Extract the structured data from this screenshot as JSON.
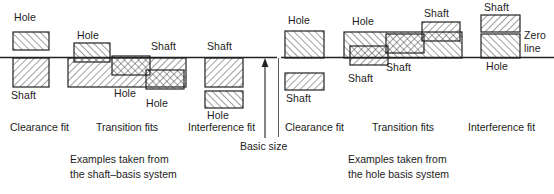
{
  "figure": {
    "zero_line_label": "Zero\nline",
    "zero_line_label_line1": "Zero",
    "zero_line_label_line2": "line",
    "basic_size_label": "Basic size",
    "colors": {
      "ink": "#1c1c1c",
      "line": "#222222",
      "hatch": "#2b2b2b",
      "background": "#ffffff"
    }
  },
  "panels": [
    {
      "id": "shaft-basis",
      "caption_line1": "Examples taken from",
      "caption_line2": "the shaft–basis system",
      "fit_labels": [
        "Clearance fit",
        "Transition fits",
        "Interference fit"
      ],
      "groups": [
        {
          "name": "clearance-fit",
          "boxes": [
            {
              "part": "Hole",
              "label": "Hole",
              "label_pos": "above"
            },
            {
              "part": "Shaft",
              "label": "Shaft",
              "label_pos": "below"
            }
          ]
        },
        {
          "name": "transition-fits",
          "boxes": [
            {
              "part": "Shaft",
              "label": "Shaft",
              "label_pos": "above"
            },
            {
              "part": "Hole",
              "label": "Hole",
              "label_pos": "above"
            },
            {
              "part": "Hole",
              "label": "Hole",
              "label_pos": "below"
            },
            {
              "part": "Hole",
              "label": "Hole",
              "label_pos": "below"
            }
          ]
        },
        {
          "name": "interference-fit",
          "boxes": [
            {
              "part": "Shaft",
              "label": "Shaft",
              "label_pos": "above"
            },
            {
              "part": "Hole",
              "label": "Hole",
              "label_pos": "below"
            }
          ]
        }
      ]
    },
    {
      "id": "hole-basis",
      "caption_line1": "Examples taken from",
      "caption_line2": "the hole  basis system",
      "fit_labels": [
        "Clearance fit",
        "Transition fits",
        "Interference fit"
      ],
      "groups": [
        {
          "name": "clearance-fit",
          "boxes": [
            {
              "part": "Hole",
              "label": "Hole",
              "label_pos": "above"
            },
            {
              "part": "Shaft",
              "label": "Shaft",
              "label_pos": "below"
            }
          ]
        },
        {
          "name": "transition-fits",
          "boxes": [
            {
              "part": "Hole",
              "label": "Hole",
              "label_pos": "above"
            },
            {
              "part": "Shaft",
              "label": "Shaft",
              "label_pos": "below"
            },
            {
              "part": "Shaft",
              "label": "Shaft",
              "label_pos": "below"
            },
            {
              "part": "Shaft",
              "label": "Shaft",
              "label_pos": "above"
            }
          ]
        },
        {
          "name": "interference-fit",
          "boxes": [
            {
              "part": "Shaft",
              "label": "Shaft",
              "label_pos": "above"
            },
            {
              "part": "Hole",
              "label": "Hole",
              "label_pos": "below"
            }
          ]
        }
      ]
    }
  ],
  "labels": {
    "l_clear_hole": "Hole",
    "l_clear_shaft": "Shaft",
    "l_trans_hole1": "Hole",
    "l_trans_shaft": "Shaft",
    "l_trans_hole2": "Hole",
    "l_trans_hole3": "Hole",
    "l_intf_shaft": "Shaft",
    "l_intf_hole": "Hole",
    "r_clear_hole": "Hole",
    "r_clear_shaft": "Shaft",
    "r_trans_hole": "Hole",
    "r_trans_shaft1": "Shaft",
    "r_trans_shaft2": "Shaft",
    "r_trans_shaft3": "Shaft",
    "r_intf_shaft": "Shaft",
    "r_intf_hole": "Hole",
    "zero_line_1": "Zero",
    "zero_line_2": "line",
    "basic_size": "Basic size",
    "fit_l_clearance": "Clearance fit",
    "fit_l_transition": "Transition fits",
    "fit_l_interference": "Interference fit",
    "fit_r_clearance": "Clearance fit",
    "fit_r_transition": "Transition fits",
    "fit_r_interference": "Interference fit",
    "cap_l_1": "Examples taken from",
    "cap_l_2": "the shaft–basis system",
    "cap_r_1": "Examples taken from",
    "cap_r_2": "the hole  basis system"
  }
}
